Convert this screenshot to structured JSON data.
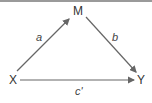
{
  "diagram": {
    "type": "mediation",
    "nodes": {
      "m": "M",
      "x": "X",
      "y": "Y"
    },
    "edges": [
      {
        "from": "X",
        "to": "M",
        "label": "a"
      },
      {
        "from": "M",
        "to": "Y",
        "label": "b"
      },
      {
        "from": "X",
        "to": "Y",
        "label": "c'"
      }
    ],
    "colors": {
      "line": "#666666",
      "text": "#333333",
      "border": "#9a9a9a"
    }
  }
}
